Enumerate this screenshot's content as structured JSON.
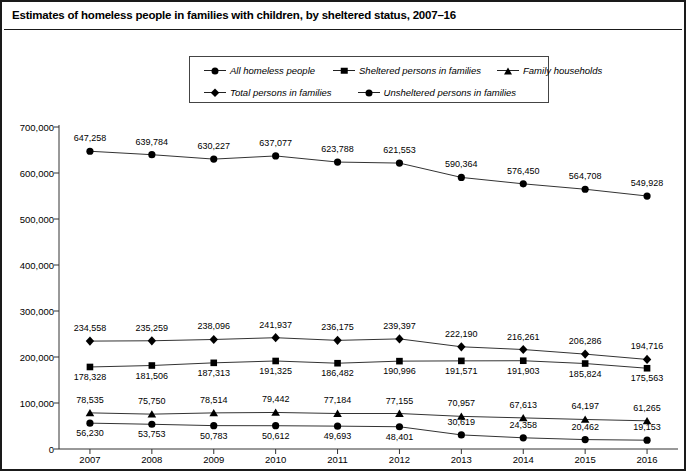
{
  "title": "Estimates of homeless people in families with children, by sheltered status, 2007–16",
  "legend": {
    "row1": [
      {
        "label": "All homeless people",
        "marker": "circle"
      },
      {
        "label": "Sheltered persons in families",
        "marker": "square"
      },
      {
        "label": "Family households",
        "marker": "triangle"
      }
    ],
    "row2": [
      {
        "label": "Total persons in families",
        "marker": "diamond"
      },
      {
        "label": "Unsheltered persons in families",
        "marker": "circle"
      }
    ]
  },
  "chart_data": {
    "type": "line",
    "title": "Estimates of homeless people in families with children, by sheltered status, 2007–16",
    "xlabel": "",
    "ylabel": "",
    "x": [
      2007,
      2008,
      2009,
      2010,
      2011,
      2012,
      2013,
      2014,
      2015,
      2016
    ],
    "categories": [
      "2007",
      "2008",
      "2009",
      "2010",
      "2011",
      "2012",
      "2013",
      "2014",
      "2015",
      "2016"
    ],
    "ylim": [
      0,
      700000
    ],
    "ytick_values": [
      0,
      100000,
      200000,
      300000,
      400000,
      500000,
      600000,
      700000
    ],
    "ytick_labels": [
      "0",
      "100,000",
      "200,000",
      "300,000",
      "400,000",
      "500,000",
      "600,000",
      "700,000"
    ],
    "grid": false,
    "legend_position": "top-center",
    "series": [
      {
        "name": "All homeless people",
        "marker": "circle",
        "values": [
          647258,
          639784,
          630227,
          637077,
          623788,
          621553,
          590364,
          576450,
          564708,
          549928
        ],
        "labels": [
          "647,258",
          "639,784",
          "630,227",
          "637,077",
          "623,788",
          "621,553",
          "590,364",
          "576,450",
          "564,708",
          "549,928"
        ],
        "label_side": [
          "above",
          "above",
          "above",
          "above",
          "above",
          "above",
          "above",
          "above",
          "above",
          "above"
        ]
      },
      {
        "name": "Total persons in families",
        "marker": "diamond",
        "values": [
          234558,
          235259,
          238096,
          241937,
          236175,
          239397,
          222190,
          216261,
          206286,
          194716
        ],
        "labels": [
          "234,558",
          "235,259",
          "238,096",
          "241,937",
          "236,175",
          "239,397",
          "222,190",
          "216,261",
          "206,286",
          "194,716"
        ],
        "label_side": [
          "above",
          "above",
          "above",
          "above",
          "above",
          "above",
          "above",
          "above",
          "above",
          "above"
        ]
      },
      {
        "name": "Sheltered persons in families",
        "marker": "square",
        "values": [
          178328,
          181506,
          187313,
          191325,
          186482,
          190996,
          191571,
          191903,
          185824,
          175563
        ],
        "labels": [
          "178,328",
          "181,506",
          "187,313",
          "191,325",
          "186,482",
          "190,996",
          "191,571",
          "191,903",
          "185,824",
          "175,563"
        ],
        "label_side": [
          "below",
          "below",
          "below",
          "below",
          "below",
          "below",
          "below",
          "below",
          "below",
          "below"
        ]
      },
      {
        "name": "Family households",
        "marker": "triangle",
        "values": [
          78535,
          75750,
          78514,
          79442,
          77184,
          77155,
          70957,
          67613,
          64197,
          61265
        ],
        "labels": [
          "78,535",
          "75,750",
          "78,514",
          "79,442",
          "77,184",
          "77,155",
          "70,957",
          "67,613",
          "64,197",
          "61,265"
        ],
        "label_side": [
          "above",
          "above",
          "above",
          "above",
          "above",
          "above",
          "above",
          "above",
          "above",
          "above"
        ]
      },
      {
        "name": "Unsheltered persons in families",
        "marker": "circle",
        "values": [
          56230,
          53753,
          50783,
          50612,
          49693,
          48401,
          30619,
          24358,
          20462,
          19153
        ],
        "labels": [
          "56,230",
          "53,753",
          "50,783",
          "50,612",
          "49,693",
          "48,401",
          "30,619",
          "24,358",
          "20,462",
          "19,153"
        ],
        "label_side": [
          "below",
          "below",
          "below",
          "below",
          "below",
          "below",
          "above",
          "above",
          "above",
          "above"
        ]
      }
    ]
  }
}
